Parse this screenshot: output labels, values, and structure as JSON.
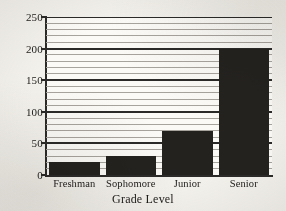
{
  "chart_data": {
    "type": "bar",
    "title": "",
    "xlabel": "Grade Level",
    "ylabel": "",
    "categories": [
      "Freshman",
      "Sophomore",
      "Junior",
      "Senior"
    ],
    "values": [
      20,
      30,
      70,
      200
    ],
    "ylim": [
      0,
      250
    ],
    "y_ticks": [
      0,
      50,
      100,
      150,
      200,
      250
    ],
    "y_tick_labels": [
      "0",
      "50",
      "100",
      "150",
      "200",
      "250"
    ],
    "minor_tick_step": 10,
    "grid": {
      "horizontal": true,
      "vertical": false,
      "major_color": "#2c2a28",
      "minor_color": "#a7a39d"
    },
    "legend": null,
    "bar_color": "#24221f",
    "plot_background": "#fbfaf7",
    "page_background": "#f3f1ec"
  },
  "axis": {
    "x_title": "Grade Level"
  }
}
